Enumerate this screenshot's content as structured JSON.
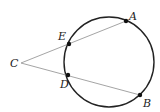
{
  "diagram": {
    "colors": {
      "circle": "#222222",
      "secant": "#9a9a9a",
      "point": "#111111",
      "label": "#222222",
      "background": "#ffffff"
    },
    "circle": {
      "cx": 109,
      "cy": 62,
      "r": 45
    },
    "points": [
      {
        "name": "C",
        "x": 21,
        "y": 63,
        "label": "C",
        "lx": 10,
        "ly": 67
      },
      {
        "name": "E",
        "x": 69,
        "y": 44,
        "label": "E",
        "lx": 58,
        "ly": 40
      },
      {
        "name": "A",
        "x": 126,
        "y": 21,
        "label": "A",
        "lx": 129,
        "ly": 20
      },
      {
        "name": "D",
        "x": 68,
        "y": 75,
        "label": "D",
        "lx": 60,
        "ly": 88
      },
      {
        "name": "B",
        "x": 140,
        "y": 95,
        "label": "B",
        "lx": 143,
        "ly": 107
      }
    ],
    "segments": [
      {
        "name": "secant-CA",
        "from": "C",
        "to": "A"
      },
      {
        "name": "secant-CB",
        "from": "C",
        "to": "B"
      }
    ]
  }
}
